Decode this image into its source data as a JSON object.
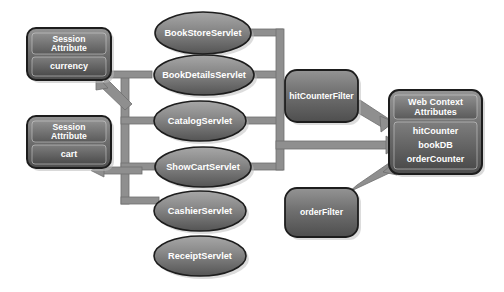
{
  "diagram": {
    "background_color": "#ffffff",
    "palette": {
      "node_fill_light": "#9a9a9a",
      "node_fill_dark": "#5d5d5d",
      "node_stroke": "#1d1d1d",
      "connector": "#8d8d8d",
      "connector_edge": "#6e6e6e",
      "label_color": "#ffffff",
      "shadow": "#b9b9b9"
    }
  },
  "session_attributes": [
    {
      "header": "Session\nAttribute",
      "header_line1": "Session",
      "header_line2": "Attribute",
      "value": "currency"
    },
    {
      "header": "Session\nAttribute",
      "header_line1": "Session",
      "header_line2": "Attribute",
      "value": "cart"
    }
  ],
  "servlets": [
    {
      "label": "BookStoreServlet"
    },
    {
      "label": "BookDetailsServlet"
    },
    {
      "label": "CatalogServlet"
    },
    {
      "label": "ShowCartServlet"
    },
    {
      "label": "CashierServlet"
    },
    {
      "label": "ReceiptServlet"
    }
  ],
  "filters": [
    {
      "label": "hitCounterFilter"
    },
    {
      "label": "orderFilter"
    }
  ],
  "web_context": {
    "header_line1": "Web Context",
    "header_line2": "Attributes",
    "items": [
      "hitCounter",
      "bookDB",
      "orderCounter"
    ]
  }
}
